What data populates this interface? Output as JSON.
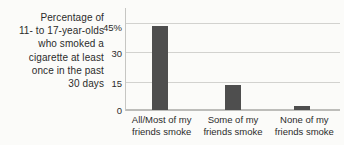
{
  "chart_data": {
    "type": "bar",
    "title": "",
    "ylabel": "Percentage of\n11- to 17-year-olds\nwho smoked a\ncigarette at least\nonce in the past\n30 days",
    "xlabel": "",
    "categories": [
      "All/Most of my\nfriends smoke",
      "Some of my\nfriends smoke",
      "None of my\nfriends smoke"
    ],
    "values": [
      43,
      13,
      2
    ],
    "yticks": [
      {
        "value": 45,
        "label": "45%"
      },
      {
        "value": 30,
        "label": "30"
      },
      {
        "value": 15,
        "label": "15"
      },
      {
        "value": 0,
        "label": "0"
      }
    ],
    "ylim": [
      0,
      45
    ],
    "grid": true,
    "legend": "none",
    "bar_color": "#4e4e4e",
    "gridline_color": "#d2d2cf",
    "background_color": "#fbfbf9",
    "text_color": "#2b2b2b"
  }
}
